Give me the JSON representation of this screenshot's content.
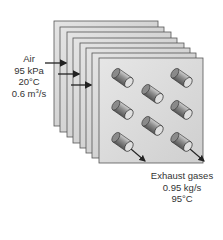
{
  "diagram": {
    "type": "heat-exchanger-plates",
    "plate_count": 8,
    "tube_rows": 3,
    "tube_count": 8
  },
  "air": {
    "name": "Air",
    "pressure": "95 kPa",
    "temperature": "20°C",
    "flow_prefix": "0.6 m",
    "flow_exp": "3",
    "flow_suffix": "/s"
  },
  "exhaust": {
    "name": "Exhaust gases",
    "mass_flow": "0.95 kg/s",
    "temperature": "95°C"
  }
}
